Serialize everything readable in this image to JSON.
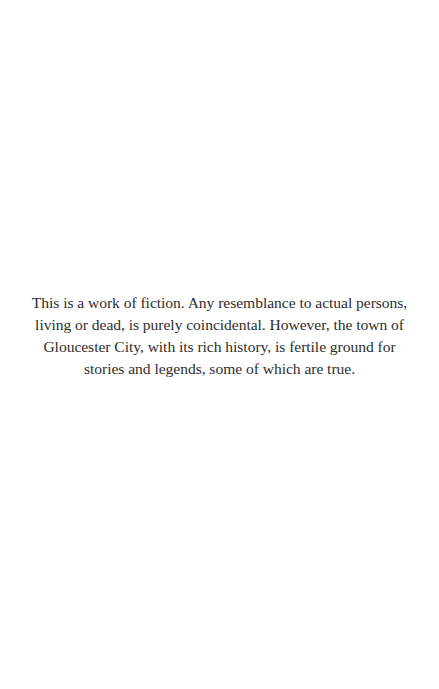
{
  "page": {
    "disclaimer": {
      "lines": [
        "This is a work of fiction. Any resemblance to actual persons,",
        "living or dead, is purely coincidental. However, the town of",
        "Gloucester City, with its rich history, is fertile ground for",
        "stories and legends, some of which are true."
      ]
    }
  }
}
